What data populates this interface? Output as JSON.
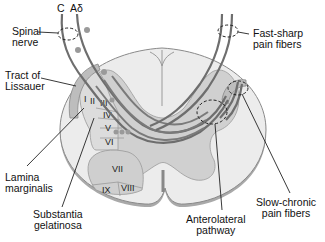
{
  "figure": {
    "fiber_labels": {
      "c": "C",
      "a_delta": "Aδ"
    },
    "labels": {
      "spinal_nerve": [
        "Spinal",
        "nerve"
      ],
      "tract_of_lissauer": [
        "Tract of",
        "Lissauer"
      ],
      "lamina_marginalis": [
        "Lamina",
        "marginalis"
      ],
      "substantia_gelatinosa": [
        "Substantia",
        "gelatinosa"
      ],
      "anterolateral_pathway": [
        "Anterolateral",
        "pathway"
      ],
      "fast_sharp": [
        "Fast-sharp",
        "pain fibers"
      ],
      "slow_chronic": [
        "Slow-chronic",
        "pain fibers"
      ]
    },
    "laminae": [
      "I",
      "II",
      "III",
      "IV",
      "V",
      "VI",
      "VII",
      "VIII",
      "IX"
    ],
    "colors": {
      "white_matter": "#e9e9e9",
      "gray_matter": "#c8c8c8",
      "outline": "#8a8a8a",
      "fiber": "#6e6e6e",
      "text": "#111111"
    }
  }
}
